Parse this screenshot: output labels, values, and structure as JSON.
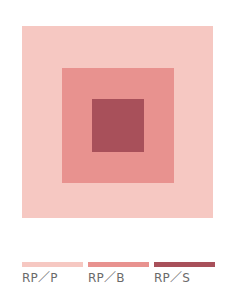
{
  "colors": {
    "pale": "#f6c8c2",
    "bright": "#e8928f",
    "strong": "#a8505a",
    "label_text": "#6a6a6a"
  },
  "squares": [
    {
      "id": "outer",
      "tone": "RP/P",
      "color": "#f6c8c2"
    },
    {
      "id": "middle",
      "tone": "RP/B",
      "color": "#e8928f"
    },
    {
      "id": "inner",
      "tone": "RP/S",
      "color": "#a8505a"
    }
  ],
  "legend": {
    "items": [
      {
        "label": "RP／P",
        "color": "#f6c8c2"
      },
      {
        "label": "RP／B",
        "color": "#e8928f"
      },
      {
        "label": "RP／S",
        "color": "#a8505a"
      }
    ]
  }
}
